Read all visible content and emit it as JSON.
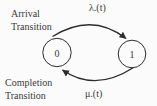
{
  "diagram": {
    "type": "state-transition-diagram",
    "background_color": "#fbfbfb",
    "line_color": "#2d2d2d",
    "text_color": "#3a3a3a",
    "states": [
      {
        "label": "0"
      },
      {
        "label": "1"
      }
    ],
    "transitions": [
      {
        "from": "0",
        "to": "1",
        "rate_label": "λ.(t)",
        "name_line1": "Arrival",
        "name_line2": "Transition",
        "arc_position": "top"
      },
      {
        "from": "1",
        "to": "0",
        "rate_label": "μ.(t)",
        "name_line1": "Completion",
        "name_line2": "Transition",
        "arc_position": "bottom"
      }
    ]
  }
}
